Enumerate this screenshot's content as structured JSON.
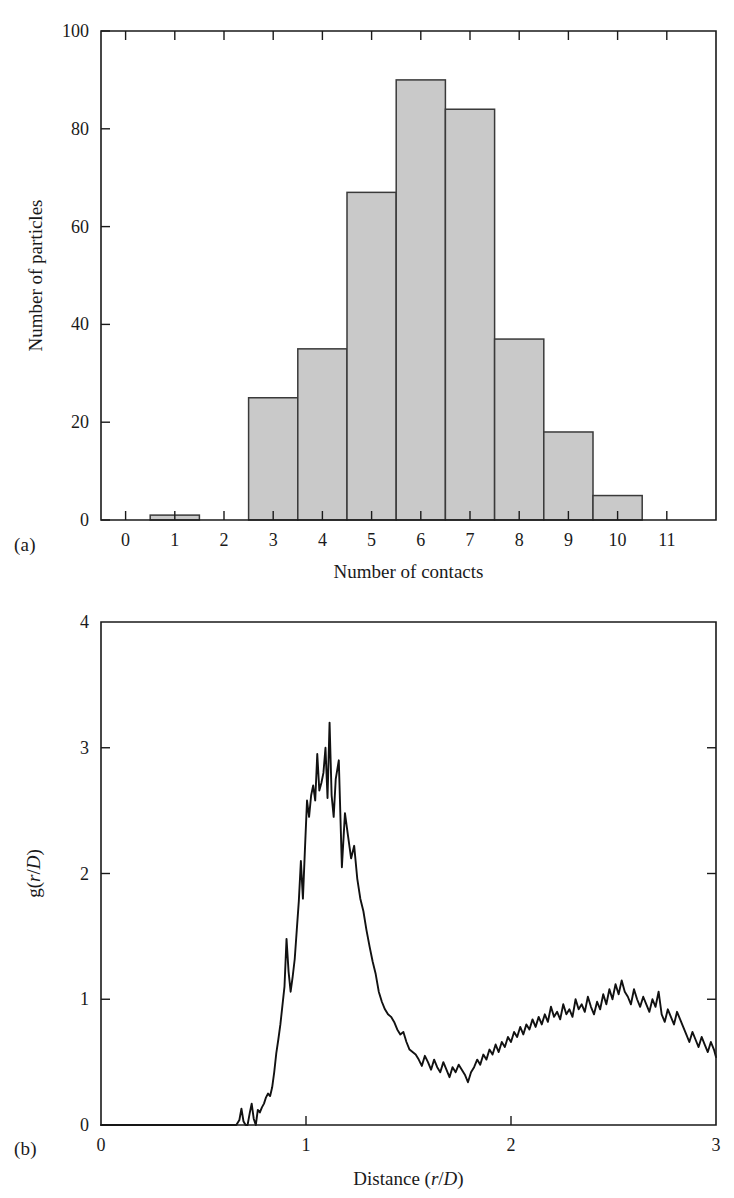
{
  "figure": {
    "panel_a_tag": "(a)",
    "panel_b_tag": "(b)"
  },
  "chart_data": [
    {
      "type": "bar",
      "panel": "(a)",
      "title": "",
      "xlabel": "Number of contacts",
      "ylabel": "Number of particles",
      "categories": [
        0,
        1,
        2,
        3,
        4,
        5,
        6,
        7,
        8,
        9,
        10,
        11
      ],
      "values": [
        0,
        1,
        0,
        25,
        35,
        67,
        90,
        84,
        37,
        18,
        5,
        0
      ],
      "xlim": [
        -0.5,
        12.0
      ],
      "ylim": [
        0,
        100
      ],
      "xticks": [
        0,
        1,
        2,
        3,
        4,
        5,
        6,
        7,
        8,
        9,
        10,
        11
      ],
      "xtick_labels": [
        "0",
        "1",
        "2",
        "3",
        "4",
        "5",
        "6",
        "7",
        "8",
        "9",
        "10",
        "11"
      ],
      "yticks": [
        0,
        20,
        40,
        60,
        80,
        100
      ],
      "ytick_labels": [
        "0",
        "20",
        "40",
        "60",
        "80",
        "100"
      ],
      "bar_width": 1.0,
      "bar_fill": "#c9c9c9",
      "bar_edge": "#3a3a3a",
      "grid": false,
      "legend": "none"
    },
    {
      "type": "line",
      "panel": "(b)",
      "title": "",
      "xlabel": "Distance (r/D)",
      "ylabel": "g(r/D)",
      "xlim": [
        0,
        3
      ],
      "ylim": [
        0,
        4
      ],
      "xticks": [
        0,
        1,
        2,
        3
      ],
      "xtick_labels": [
        "0",
        "1",
        "2",
        "3"
      ],
      "yticks": [
        0,
        1,
        2,
        3,
        4
      ],
      "ytick_labels": [
        "0",
        "1",
        "2",
        "3",
        "4"
      ],
      "grid": false,
      "legend": "none",
      "line_color": "#111111",
      "annotations": {
        "first_peak_x": 1.02,
        "first_peak_y": 3.2,
        "onset_x": 0.68,
        "minimum_x": 1.4,
        "minimum_y": 0.38,
        "second_peak_x": 1.88,
        "second_peak_y": 1.15,
        "tail_mean": 0.62
      },
      "x": [
        0.0,
        0.02,
        0.04,
        0.06,
        0.08,
        0.1,
        0.12,
        0.14,
        0.16,
        0.18,
        0.2,
        0.22,
        0.24,
        0.26,
        0.28,
        0.3,
        0.32,
        0.34,
        0.36,
        0.38,
        0.4,
        0.42,
        0.44,
        0.46,
        0.48,
        0.5,
        0.52,
        0.54,
        0.56,
        0.58,
        0.6,
        0.62,
        0.64,
        0.66,
        0.675,
        0.685,
        0.695,
        0.705,
        0.715,
        0.725,
        0.735,
        0.745,
        0.755,
        0.765,
        0.775,
        0.785,
        0.795,
        0.805,
        0.815,
        0.825,
        0.835,
        0.845,
        0.855,
        0.865,
        0.875,
        0.885,
        0.895,
        0.905,
        0.915,
        0.925,
        0.935,
        0.945,
        0.955,
        0.965,
        0.975,
        0.985,
        0.995,
        1.005,
        1.015,
        1.025,
        1.035,
        1.045,
        1.055,
        1.065,
        1.075,
        1.085,
        1.095,
        1.105,
        1.115,
        1.125,
        1.135,
        1.145,
        1.16,
        1.175,
        1.19,
        1.205,
        1.22,
        1.235,
        1.25,
        1.265,
        1.28,
        1.295,
        1.31,
        1.325,
        1.34,
        1.355,
        1.37,
        1.385,
        1.4,
        1.415,
        1.43,
        1.445,
        1.46,
        1.475,
        1.49,
        1.505,
        1.52,
        1.535,
        1.55,
        1.565,
        1.58,
        1.595,
        1.61,
        1.625,
        1.64,
        1.655,
        1.67,
        1.685,
        1.7,
        1.715,
        1.73,
        1.745,
        1.76,
        1.775,
        1.79,
        1.805,
        1.82,
        1.835,
        1.85,
        1.865,
        1.88,
        1.895,
        1.91,
        1.925,
        1.94,
        1.955,
        1.97,
        1.985,
        2.0,
        2.015,
        2.03,
        2.045,
        2.06,
        2.075,
        2.09,
        2.105,
        2.12,
        2.135,
        2.15,
        2.165,
        2.18,
        2.195,
        2.21,
        2.225,
        2.24,
        2.255,
        2.27,
        2.285,
        2.3,
        2.315,
        2.33,
        2.345,
        2.36,
        2.375,
        2.39,
        2.405,
        2.42,
        2.435,
        2.45,
        2.465,
        2.48,
        2.495,
        2.51,
        2.525,
        2.54,
        2.555,
        2.57,
        2.585,
        2.6,
        2.615,
        2.63,
        2.645,
        2.66,
        2.675,
        2.69,
        2.705,
        2.72,
        2.735,
        2.75,
        2.765,
        2.78,
        2.795,
        2.81,
        2.825,
        2.84,
        2.855,
        2.87,
        2.885,
        2.9,
        2.915,
        2.93,
        2.945,
        2.96,
        2.975,
        2.99,
        3.0
      ],
      "y": [
        0.0,
        0.0,
        0.0,
        0.0,
        0.0,
        0.0,
        0.0,
        0.0,
        0.0,
        0.0,
        0.0,
        0.0,
        0.0,
        0.0,
        0.0,
        0.0,
        0.0,
        0.0,
        0.0,
        0.0,
        0.0,
        0.0,
        0.0,
        0.0,
        0.0,
        0.0,
        0.0,
        0.0,
        0.0,
        0.0,
        0.0,
        0.0,
        0.0,
        0.0,
        0.04,
        0.13,
        0.03,
        0.0,
        0.0,
        0.09,
        0.17,
        0.05,
        0.0,
        0.12,
        0.1,
        0.14,
        0.17,
        0.22,
        0.25,
        0.23,
        0.3,
        0.42,
        0.57,
        0.68,
        0.8,
        0.95,
        1.1,
        1.48,
        1.22,
        1.06,
        1.18,
        1.32,
        1.55,
        1.78,
        2.1,
        1.8,
        2.2,
        2.58,
        2.45,
        2.62,
        2.7,
        2.58,
        2.95,
        2.66,
        2.72,
        2.8,
        3.0,
        2.6,
        3.2,
        2.62,
        2.45,
        2.75,
        2.9,
        2.05,
        2.48,
        2.3,
        2.12,
        2.22,
        1.96,
        1.8,
        1.7,
        1.55,
        1.42,
        1.3,
        1.2,
        1.06,
        0.98,
        0.92,
        0.88,
        0.86,
        0.82,
        0.76,
        0.72,
        0.74,
        0.66,
        0.6,
        0.58,
        0.56,
        0.52,
        0.47,
        0.55,
        0.5,
        0.44,
        0.52,
        0.46,
        0.42,
        0.5,
        0.44,
        0.38,
        0.46,
        0.42,
        0.48,
        0.44,
        0.4,
        0.34,
        0.42,
        0.46,
        0.52,
        0.48,
        0.56,
        0.52,
        0.6,
        0.56,
        0.64,
        0.58,
        0.66,
        0.62,
        0.7,
        0.66,
        0.74,
        0.7,
        0.78,
        0.72,
        0.8,
        0.76,
        0.84,
        0.78,
        0.86,
        0.8,
        0.88,
        0.82,
        0.94,
        0.86,
        0.9,
        0.84,
        0.96,
        0.88,
        0.92,
        0.86,
        1.0,
        0.92,
        0.96,
        0.9,
        1.02,
        0.94,
        0.88,
        0.98,
        0.92,
        1.04,
        0.96,
        1.08,
        1.0,
        1.12,
        1.04,
        1.15,
        1.06,
        1.02,
        0.96,
        1.08,
        1.0,
        0.94,
        1.02,
        0.96,
        0.9,
        1.0,
        0.94,
        1.06,
        0.88,
        0.82,
        0.92,
        0.86,
        0.8,
        0.9,
        0.84,
        0.78,
        0.72,
        0.66,
        0.74,
        0.68,
        0.62,
        0.7,
        0.64,
        0.58,
        0.66,
        0.6,
        0.54,
        0.62,
        0.56,
        0.5,
        0.44,
        0.52,
        0.46,
        0.4,
        0.48,
        0.42,
        0.36,
        0.44,
        0.38,
        0.46,
        0.4,
        0.48,
        0.42,
        0.5,
        0.44,
        0.52,
        0.46,
        0.54,
        0.48,
        0.56,
        0.5,
        0.58,
        0.52,
        0.6,
        0.54,
        0.62,
        0.56,
        0.64,
        0.58,
        0.66,
        0.6,
        0.68,
        0.62,
        0.7,
        0.64,
        0.58,
        0.66,
        0.6,
        0.68,
        0.62,
        0.56,
        0.64,
        0.58,
        0.66,
        0.6,
        0.54,
        0.62,
        0.56,
        0.64,
        0.58,
        0.52,
        0.6,
        0.54,
        0.62,
        0.56,
        0.5,
        0.58,
        0.52
      ]
    }
  ]
}
